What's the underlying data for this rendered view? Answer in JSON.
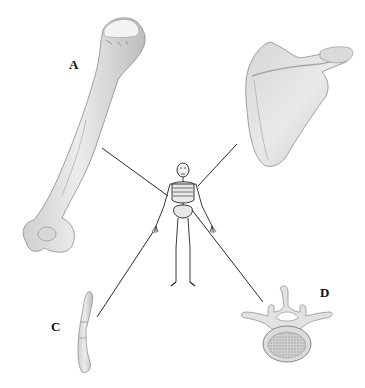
{
  "diagram": {
    "type": "anatomy-bone-identification",
    "background": "#ffffff",
    "center_figure": "full human skeleton (anterior view)",
    "labels": [
      {
        "id": "A",
        "text": "A",
        "x": 69,
        "y": 58,
        "bone": "humerus"
      },
      {
        "id": "B",
        "text": "",
        "bone": "scapula"
      },
      {
        "id": "C",
        "text": "C",
        "x": 51,
        "y": 320,
        "bone": "finger phalanges"
      },
      {
        "id": "D",
        "text": "D",
        "x": 320,
        "y": 286,
        "bone": "lumbar vertebra (superior view)"
      }
    ],
    "leader_lines": [
      {
        "from": "humerus",
        "x1": 102,
        "y1": 148,
        "x2": 168,
        "y2": 196
      },
      {
        "from": "scapula",
        "x1": 237,
        "y1": 144,
        "x2": 198,
        "y2": 186
      },
      {
        "from": "phalanges",
        "x1": 97,
        "y1": 317,
        "x2": 153,
        "y2": 232
      },
      {
        "from": "vertebra",
        "x1": 192,
        "y1": 210,
        "x2": 263,
        "y2": 302
      }
    ],
    "colors": {
      "bone_fill": "#e4e4e4",
      "bone_shade": "#c9c9c9",
      "bone_outline": "#8a8a8a",
      "line": "#2a2a2a",
      "text": "#111111"
    }
  }
}
